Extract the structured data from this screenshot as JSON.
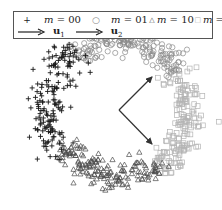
{
  "chart_data": {
    "type": "scatter",
    "title": "",
    "xlabel": "",
    "ylabel": "",
    "grid": false,
    "axes_visible": false,
    "legend_position": "top",
    "center_px": [
      119,
      110
    ],
    "series": [
      {
        "name": "m = 00",
        "label_var": "m",
        "label_val": "00",
        "marker": "plus",
        "color": "#1a1a1a",
        "arc_deg": [
          145,
          232
        ],
        "radius_px": 74,
        "radial_jitter_px": 9,
        "count": 170
      },
      {
        "name": "m = 01",
        "label_var": "m",
        "label_val": "01",
        "marker": "circle",
        "color": "#8a8a8a",
        "arc_deg": [
          232,
          325
        ],
        "radius_px": 70,
        "radial_jitter_px": 7,
        "count": 170
      },
      {
        "name": "m = 10",
        "label_var": "m",
        "label_val": "10",
        "marker": "triangle",
        "color": "#4a4a4a",
        "arc_deg": [
          55,
          145
        ],
        "radius_px": 66,
        "radial_jitter_px": 8,
        "count": 170
      },
      {
        "name": "m = 11",
        "label_var": "m",
        "label_val": "11",
        "marker": "square",
        "color": "#b4b4b4",
        "arc_deg": [
          -35,
          55
        ],
        "radius_px": 70,
        "radial_jitter_px": 8,
        "count": 170
      }
    ],
    "vectors": [
      {
        "name": "u1",
        "label": "u",
        "sub": "1",
        "from_px": [
          119,
          110
        ],
        "to_px": [
          152,
          77
        ],
        "color": "#333333"
      },
      {
        "name": "u2",
        "label": "u",
        "sub": "2",
        "from_px": [
          119,
          110
        ],
        "to_px": [
          152,
          144
        ],
        "color": "#333333"
      }
    ]
  },
  "legend": {
    "row1": [
      {
        "marker_glyph": "+",
        "var": "m",
        "eq": " = ",
        "val": "00"
      },
      {
        "marker_glyph": "○",
        "var": "m",
        "eq": " = ",
        "val": "01"
      },
      {
        "marker_glyph": "△",
        "var": "m",
        "eq": " = ",
        "val": "10"
      },
      {
        "marker_glyph": "□",
        "var": "m",
        "eq": " = ",
        "val": "11"
      }
    ],
    "row2": [
      {
        "vec": "u",
        "sub": "1"
      },
      {
        "vec": "u",
        "sub": "2"
      }
    ]
  }
}
